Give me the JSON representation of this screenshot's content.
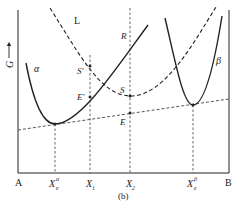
{
  "figure": {
    "caption": "(b)",
    "y_axis_label": "G",
    "x_axis_left_label": "A",
    "x_axis_right_label": "B",
    "curves": {
      "alpha": {
        "label": "α"
      },
      "beta": {
        "label": "β"
      },
      "liquid": {
        "label": "L"
      }
    },
    "points": {
      "R": "R",
      "S_prime": "S′",
      "E_prime": "E′",
      "S": "S",
      "E": "E"
    },
    "x_ticks": {
      "xe_alpha_main": "X",
      "xe_alpha_sub": "e",
      "xe_alpha_sup": "α",
      "x1_main": "X",
      "x1_sub": "1",
      "x2_main": "X",
      "x2_sub": "2",
      "xe_beta_main": "X",
      "xe_beta_sub": "e",
      "xe_beta_sup": "β"
    },
    "colors": {
      "line": "#222222",
      "dash": "#444444"
    }
  }
}
